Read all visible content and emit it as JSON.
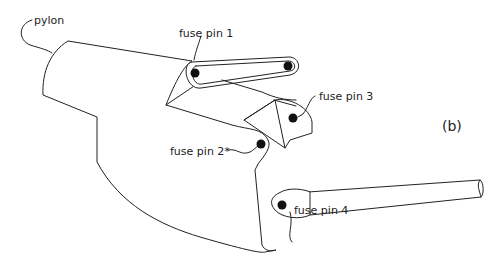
{
  "figure": {
    "panel_label": "(b)",
    "labels": {
      "pylon": "pylon",
      "fuse_pin_1": "fuse pin 1",
      "fuse_pin_2": "fuse pin 2*",
      "fuse_pin_3": "fuse pin 3",
      "fuse_pin_4": "fuse pin 4"
    },
    "colors": {
      "line": "#222222",
      "pin": "#111111",
      "background": "#ffffff"
    }
  }
}
